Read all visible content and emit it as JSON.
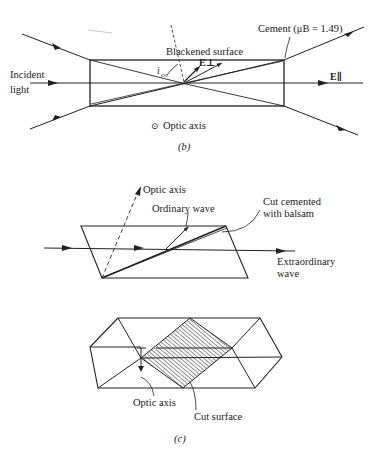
{
  "figure_b": {
    "labels": {
      "cement": "Cement (μB = 1.49)",
      "blackened_surface": "Blackened surface",
      "angle": "i",
      "angle_sub": "co",
      "e_perp": "E⊥",
      "e_par": "E∥",
      "incident_line1": "Incident",
      "incident_line2": "light",
      "optic_axis_symbol": "⊙",
      "optic_axis": "Optic axis"
    },
    "caption": "(b)"
  },
  "figure_c": {
    "labels": {
      "optic_axis": "Optic axis",
      "ordinary_wave": "Ordinary wave",
      "cut_cemented_line1": "Cut cemented",
      "cut_cemented_line2": "with balsam",
      "extraordinary_line1": "Extraordinary",
      "extraordinary_line2": "wave",
      "optic_axis_bottom": "Optic axis",
      "cut_surface": "Cut surface"
    },
    "caption": "(c)"
  },
  "colors": {
    "ink": "#222222",
    "background": "#ffffff"
  }
}
